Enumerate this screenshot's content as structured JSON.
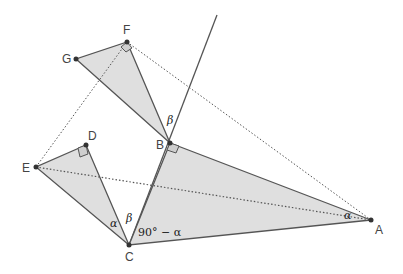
{
  "diagram": {
    "title": "",
    "colors": {
      "fill": "#d9d9d9",
      "stroke": "#555555",
      "point": "#333333",
      "dotted": "#555555"
    },
    "points": {
      "A": {
        "label": "A",
        "x": 371,
        "y": 220
      },
      "B": {
        "label": "B",
        "x": 170,
        "y": 143
      },
      "C": {
        "label": "C",
        "x": 129,
        "y": 245
      },
      "D": {
        "label": "D",
        "x": 86,
        "y": 145
      },
      "E": {
        "label": "E",
        "x": 36,
        "y": 167
      },
      "F": {
        "label": "F",
        "x": 127,
        "y": 42
      },
      "G": {
        "label": "G",
        "x": 76,
        "y": 59
      }
    },
    "triangles": [
      "ABC",
      "BFG",
      "CDE"
    ],
    "right_angles": [
      "B",
      "D",
      "F"
    ],
    "angle_labels": {
      "alpha_A": "α",
      "alpha_C": "α",
      "beta_C": "β",
      "beta_B": "β",
      "c_complement": "90° − α"
    },
    "dotted_segments": [
      "EF",
      "FA",
      "EA"
    ],
    "ray": "C through B"
  }
}
